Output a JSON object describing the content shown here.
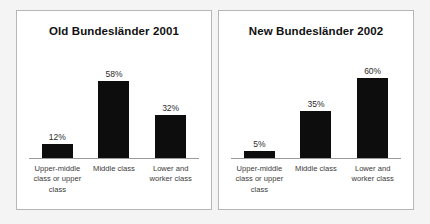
{
  "chart_data": [
    {
      "type": "bar",
      "title": "Old Bundesländer 2001",
      "categories": [
        "Upper-middle class or upper class",
        "Middle class",
        "Lower and worker class"
      ],
      "values": [
        12,
        32,
        58
      ],
      "value_labels": [
        "12%",
        "58%",
        "32%"
      ],
      "plotted_values": [
        12,
        58,
        32
      ],
      "xlabel": "",
      "ylabel": "",
      "ylim": [
        0,
        65
      ],
      "grid": false,
      "legend": "none",
      "bar_color": "#0d0d0d"
    },
    {
      "type": "bar",
      "title": "New Bundesländer 2002",
      "categories": [
        "Upper-middle class or upper class",
        "Middle class",
        "Lower and worker class"
      ],
      "values": [
        5,
        35,
        60
      ],
      "value_labels": [
        "5%",
        "35%",
        "60%"
      ],
      "plotted_values": [
        5,
        35,
        60
      ],
      "xlabel": "",
      "ylabel": "",
      "ylim": [
        0,
        65
      ],
      "grid": false,
      "legend": "none",
      "bar_color": "#0d0d0d"
    }
  ],
  "panels": [
    {
      "title": "Old Bundesländer 2001",
      "bars": [
        {
          "label": "12%",
          "category": "Upper-middle class or upper class",
          "height_px": 14
        },
        {
          "label": "58%",
          "category": "Middle class",
          "height_px": 77
        },
        {
          "label": "32%",
          "category": "Lower and worker class",
          "height_px": 43
        }
      ]
    },
    {
      "title": "New Bundesländer 2002",
      "bars": [
        {
          "label": "5%",
          "category": "Upper-middle class or upper class",
          "height_px": 7
        },
        {
          "label": "35%",
          "category": "Middle class",
          "height_px": 47
        },
        {
          "label": "60%",
          "category": "Lower and worker class",
          "height_px": 80
        }
      ]
    }
  ]
}
